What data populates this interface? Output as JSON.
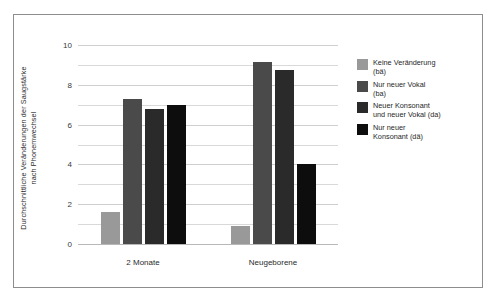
{
  "chart_data": {
    "type": "bar",
    "title": "",
    "subtitle": "",
    "xlabel": "",
    "ylabel": "Durchschnittliche Veränderungen der Saugstärke nach Phonemwechsel",
    "ylabel_line1": "Durchschnittliche Veränderungen der Saugstärke",
    "ylabel_line2": "nach Phonemwechsel",
    "categories": [
      "2 Monate",
      "Neugeborene"
    ],
    "ylim": [
      0,
      10
    ],
    "yticks": [
      0,
      2,
      4,
      6,
      8,
      10
    ],
    "ytick_labels": [
      "0",
      "2",
      "4",
      "6",
      "8",
      "10"
    ],
    "minor_gridlines": [
      1,
      3,
      5,
      7,
      9
    ],
    "grid": true,
    "legend_position": "right",
    "series": [
      {
        "name": "Keine Veränderung (bä)",
        "label_line1": "Keine Veränderung",
        "label_line2": "(bä)",
        "color": "#999999",
        "values": [
          1.6,
          0.9
        ]
      },
      {
        "name": "Nur neuer Vokal (ba)",
        "label_line1": "Nur neuer Vokal",
        "label_line2": "(ba)",
        "color": "#4a4a4a",
        "values": [
          7.3,
          9.15
        ]
      },
      {
        "name": "Neuer Konsonant und neuer Vokal (da)",
        "label_line1": "Neuer Konsonant",
        "label_line2": "und neuer Vokal (da)",
        "color": "#2a2a2a",
        "values": [
          6.8,
          8.75
        ]
      },
      {
        "name": "Nur neuer Konsonant (dä)",
        "label_line1": "Nur neuer",
        "label_line2": "Konsonant (dä)",
        "color": "#0d0d0d",
        "values": [
          7.0,
          4.0
        ]
      }
    ]
  },
  "colors": {
    "frame": "#8d8d8d",
    "gridline": "#d9d9d9",
    "background": "#ffffff",
    "text": "#2b2b2b"
  }
}
